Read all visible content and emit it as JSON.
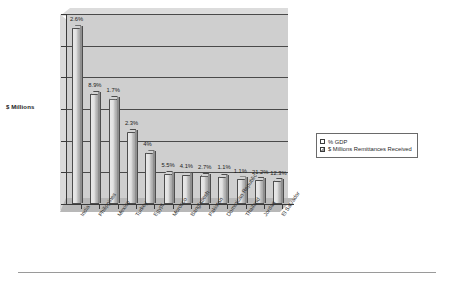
{
  "chart_data": {
    "type": "bar",
    "title": "",
    "xlabel": "",
    "ylabel": "$ Millions",
    "ylim": [
      0,
      12000
    ],
    "yticks": [
      0,
      2000,
      4000,
      6000,
      8000,
      10000,
      12000
    ],
    "ytick_labels": [
      "0",
      "2000",
      "4000",
      "6000",
      "8000",
      "10000",
      "12000"
    ],
    "grid": true,
    "legend_position": "right",
    "style": "3d-column",
    "categories": [
      "India",
      "Philippines",
      "Mexico",
      "Turkey",
      "Egypt",
      "Morocco",
      "Bangladesh",
      "Pakistan",
      "Dominican Republic",
      "Thailand",
      "Jordan",
      "El Salvador"
    ],
    "series": [
      {
        "name": "$ Millions Remittances Received",
        "values": [
          11100,
          6950,
          6650,
          4550,
          3200,
          1900,
          1830,
          1780,
          1700,
          1550,
          1520,
          1450
        ]
      }
    ],
    "point_labels": [
      "2.6%",
      "8.9%",
      "1.7%",
      "2.3%",
      "4%",
      "5.5%",
      "4.1%",
      "2.7%",
      "1.1%",
      "1.1%",
      "21.2%",
      "12.3%"
    ],
    "point_label_series": "% GDP",
    "legend": [
      "% GDP",
      "$ Millions Remittances Received"
    ]
  },
  "legend": {
    "items": [
      {
        "label": "% GDP",
        "swatch": "white-square-icon"
      },
      {
        "label": "$ Millions Remittances Received",
        "swatch": "shaded-square-icon"
      }
    ]
  },
  "axis": {
    "y_title": "$ Millions"
  }
}
